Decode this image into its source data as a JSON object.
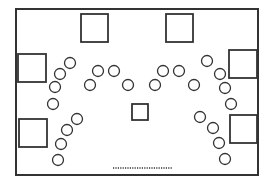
{
  "diagram": {
    "type": "floor-plan",
    "stroke_color": "#333333",
    "background": "#ffffff",
    "frame": {
      "x": 16,
      "y": 9,
      "width": 242,
      "height": 166
    },
    "tables": [
      {
        "id": "top-left",
        "x": 81,
        "y": 14,
        "w": 27,
        "h": 28
      },
      {
        "id": "top-right",
        "x": 166,
        "y": 14,
        "w": 27,
        "h": 28
      },
      {
        "id": "left-upper",
        "x": 18,
        "y": 54,
        "w": 28,
        "h": 28
      },
      {
        "id": "left-lower",
        "x": 19,
        "y": 119,
        "w": 28,
        "h": 28
      },
      {
        "id": "right-upper",
        "x": 229,
        "y": 50,
        "w": 28,
        "h": 28
      },
      {
        "id": "right-lower",
        "x": 230,
        "y": 115,
        "w": 27,
        "h": 28
      },
      {
        "id": "center",
        "x": 132,
        "y": 104,
        "w": 16,
        "h": 16
      }
    ],
    "seats": [
      {
        "cx": 70,
        "cy": 63
      },
      {
        "cx": 60,
        "cy": 74
      },
      {
        "cx": 55,
        "cy": 87
      },
      {
        "cx": 53,
        "cy": 104
      },
      {
        "cx": 77,
        "cy": 119
      },
      {
        "cx": 67,
        "cy": 130
      },
      {
        "cx": 61,
        "cy": 144
      },
      {
        "cx": 58,
        "cy": 160
      },
      {
        "cx": 98,
        "cy": 71
      },
      {
        "cx": 114,
        "cy": 71
      },
      {
        "cx": 90,
        "cy": 85
      },
      {
        "cx": 128,
        "cy": 85
      },
      {
        "cx": 163,
        "cy": 71
      },
      {
        "cx": 179,
        "cy": 71
      },
      {
        "cx": 155,
        "cy": 85
      },
      {
        "cx": 194,
        "cy": 85
      },
      {
        "cx": 207,
        "cy": 61
      },
      {
        "cx": 220,
        "cy": 74
      },
      {
        "cx": 225,
        "cy": 88
      },
      {
        "cx": 231,
        "cy": 104
      },
      {
        "cx": 200,
        "cy": 117
      },
      {
        "cx": 213,
        "cy": 128
      },
      {
        "cx": 219,
        "cy": 143
      },
      {
        "cx": 225,
        "cy": 159
      }
    ],
    "seat_radius": 5.5,
    "door": {
      "x1": 113,
      "x2": 172,
      "y": 168
    }
  }
}
